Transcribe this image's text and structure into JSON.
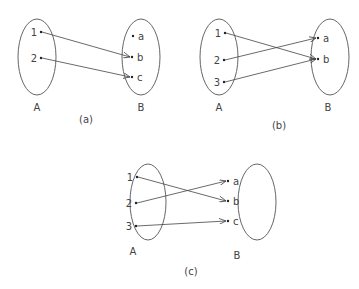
{
  "diagrams": [
    {
      "caption": "(a)",
      "domain_label": "A",
      "codomain_label": "B",
      "domain": [
        "1",
        "2"
      ],
      "codomain": [
        "a",
        "b",
        "c"
      ],
      "mappings": [
        [
          "1",
          "b"
        ],
        [
          "2",
          "c"
        ]
      ]
    },
    {
      "caption": "(b)",
      "domain_label": "A",
      "codomain_label": "B",
      "domain": [
        "1",
        "2",
        "3"
      ],
      "codomain": [
        "a",
        "b"
      ],
      "mappings": [
        [
          "1",
          "b"
        ],
        [
          "2",
          "a"
        ],
        [
          "3",
          "b"
        ]
      ]
    },
    {
      "caption": "(c)",
      "domain_label": "A",
      "codomain_label": "B",
      "domain": [
        "1",
        "2",
        "3"
      ],
      "codomain": [
        "a",
        "b",
        "c"
      ],
      "mappings": [
        [
          "1",
          "b"
        ],
        [
          "2",
          "a"
        ],
        [
          "3",
          "c"
        ]
      ]
    }
  ]
}
